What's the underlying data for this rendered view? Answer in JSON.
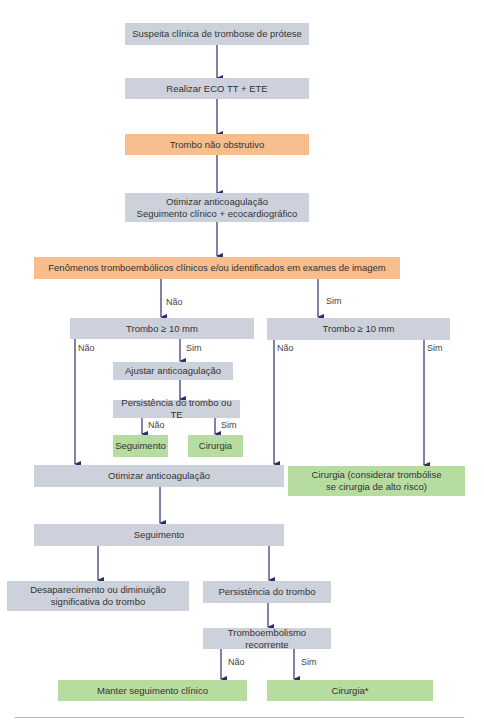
{
  "flowchart": {
    "colors": {
      "gray": "#cdd1dc",
      "orange": "#f8bd8c",
      "green": "#b6dca0",
      "arrow": "#2e2e6e",
      "rule": "#e8a0a0"
    },
    "nodes": {
      "n1": "Suspeita clínica de trombose de prótese",
      "n2": "Realizar ECO TT + ETE",
      "n3": "Trombo não obstrutivo",
      "n4": "Otimizar anticoagulação\nSeguimento clínico + ecocardiográfico",
      "n5": "Fenômenos tromboembólicos clínicos e/ou identificados em exames de imagem",
      "n6": "Trombo ≥ 10 mm",
      "n7": "Trombo ≥ 10 mm",
      "n8": "Ajustar anticoagulação",
      "n9": "Persistência do trombo ou TE",
      "n10": "Seguimento",
      "n11": "Cirurgia",
      "n12": "Otimizar anticoagulação",
      "n13": "Cirurgia (considerar trombólise\nse cirurgia de alto risco)",
      "n14": "Seguimento",
      "n15": "Desaparecimento ou diminuição\nsignificativa do trombo",
      "n16": "Persistência do trombo",
      "n17": "Tromboembolismo recorrente",
      "n18": "Manter seguimento clínico",
      "n19": "Cirurgia*"
    },
    "edge_labels": {
      "n5_nao": "Não",
      "n5_sim": "Sim",
      "n6_nao": "Não",
      "n6_sim": "Sim",
      "n7_nao": "Não",
      "n7_sim": "Sim",
      "n9_nao": "Não",
      "n9_sim": "Sim",
      "n17_nao": "Não",
      "n17_sim": "Sim"
    }
  }
}
